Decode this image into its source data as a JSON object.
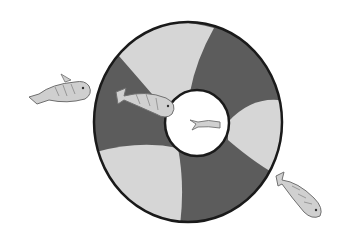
{
  "image": {
    "description": "Black-and-white hand-drawn illustration of a life ring (life buoy) with alternating dark and light segments, with four small fish swimming around and through it",
    "colors": {
      "background": "#ffffff",
      "dark_segment": "#5c5c5c",
      "light_segment": "#d6d6d6",
      "outline": "#1a1a1a",
      "fish_fill": "#c9c9c9",
      "fish_stroke": "#6e6e6e"
    },
    "objects": [
      {
        "name": "life-ring",
        "segments": 6,
        "pattern": "alternating dark/light"
      },
      {
        "name": "fish",
        "count": 4
      }
    ]
  }
}
